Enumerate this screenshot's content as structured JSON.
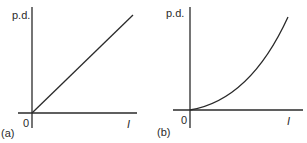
{
  "figure": {
    "panels": [
      {
        "id": "a",
        "panel_label": "(a)",
        "y_axis_label": "p.d.",
        "x_axis_label": "I",
        "origin_label": "0",
        "curve_type": "linear",
        "description": "Straight line through origin"
      },
      {
        "id": "b",
        "panel_label": "(b)",
        "y_axis_label": "p.d.",
        "x_axis_label": "I",
        "origin_label": "0",
        "curve_type": "increasing-curve",
        "description": "Curve through origin with increasing gradient"
      }
    ],
    "colors": {
      "stroke": "#2a2a2a",
      "background": "#ffffff"
    }
  }
}
